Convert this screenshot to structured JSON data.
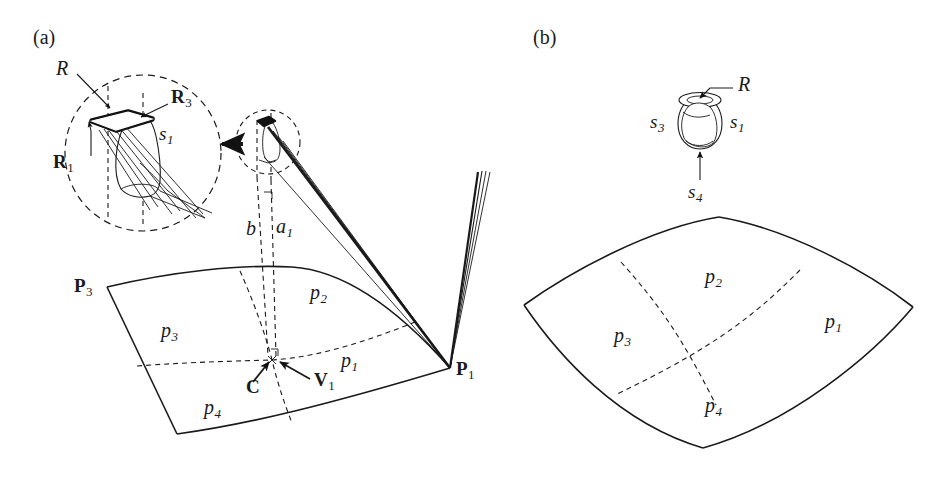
{
  "figure": {
    "background": "#ffffff",
    "ink": "#1a1a1a",
    "width": 945,
    "height": 479,
    "panels": [
      {
        "id": "a",
        "label": "(a)"
      },
      {
        "id": "b",
        "label": "(b)"
      }
    ]
  },
  "panel_a": {
    "label": "(a)",
    "detail_circle": {
      "name": "magnified-inset",
      "labels": {
        "R": "R",
        "R1_base": "R",
        "R1_sub": "1",
        "R3_base": "R",
        "R3_sub": "3",
        "s1_base": "s",
        "s1_sub": "1"
      }
    },
    "small_circle": {
      "name": "source-region"
    },
    "magnify_arrow": {
      "name": "magnify-arrow"
    },
    "distance_labels": {
      "b": "b",
      "a1_base": "a",
      "a1_sub": "1"
    },
    "patch": {
      "corner_p3_base": "P",
      "corner_p3_sub": "3",
      "corner_p1_base": "P",
      "corner_p1_sub": "1",
      "center_C": "C",
      "vector_V1_base": "V",
      "vector_V1_sub": "1",
      "subpatches": [
        {
          "base": "p",
          "sub": "1"
        },
        {
          "base": "p",
          "sub": "2"
        },
        {
          "base": "p",
          "sub": "3"
        },
        {
          "base": "p",
          "sub": "4"
        }
      ]
    }
  },
  "panel_b": {
    "label": "(b)",
    "sphere": {
      "name": "spherical-source",
      "labels": {
        "R": "R",
        "s1_base": "s",
        "s1_sub": "1",
        "s3_base": "s",
        "s3_sub": "3",
        "s4_base": "s",
        "s4_sub": "4"
      }
    },
    "patch": {
      "subpatches": [
        {
          "base": "p",
          "sub": "1"
        },
        {
          "base": "p",
          "sub": "2"
        },
        {
          "base": "p",
          "sub": "3"
        },
        {
          "base": "p",
          "sub": "4"
        }
      ]
    }
  }
}
